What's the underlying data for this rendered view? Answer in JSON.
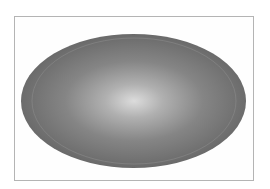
{
  "figure": {
    "shape": "ellipse",
    "fill": "radial-gradient",
    "colors": {
      "highlight": "#dcdcdc",
      "mid": "#9a9a9a",
      "edge": "#6a6a6a",
      "inner_outline": "#8c8c8c",
      "frame_border": "#b4b4b4"
    }
  }
}
